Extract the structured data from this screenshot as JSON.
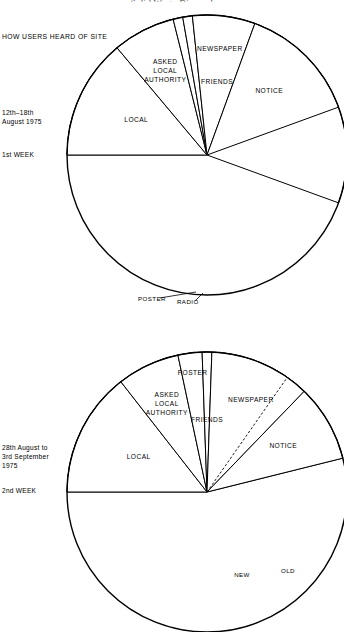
{
  "figure": {
    "title": "Solid Waste Disposal",
    "heading": "HOW USERS HEARD OF SITE"
  },
  "charts": [
    {
      "id": "week-1",
      "period_label": "12th–18th\nAugust 1975",
      "week_label": "1st WEEK",
      "center": [
        207,
        155
      ],
      "radius": 140,
      "slices": [
        {
          "name": "FRIENDS",
          "start": 180,
          "end": 380,
          "label": "FRIENDS",
          "label_r": 72,
          "label_a": 278
        },
        {
          "name": "LOCAL",
          "start": 180,
          "end": 230,
          "label": "LOCAL",
          "label_r": 78,
          "label_a": 205
        },
        {
          "name": "ASKED LOCAL AUTHORITY",
          "start": 230,
          "end": 256,
          "label": "ASKED\nLOCAL\nAUTHORITY",
          "label_r": 92,
          "label_a": 243
        },
        {
          "name": "POSTER",
          "start": 256,
          "end": 260,
          "label": null
        },
        {
          "name": "RADIO",
          "start": 260,
          "end": 264,
          "label": null
        },
        {
          "name": "NEWSPAPER",
          "start": 264,
          "end": 290,
          "label": "NEWSPAPER",
          "label_r": 105,
          "label_a": 277
        },
        {
          "name": "NOTICE",
          "start": 290,
          "end": 340,
          "label": "NOTICE",
          "label_r": 88,
          "label_a": 315
        }
      ],
      "leaders": [
        {
          "text": "POSTER",
          "x": 138,
          "y": 301,
          "to": [
            196,
            292
          ]
        },
        {
          "text": "RADIO",
          "x": 177,
          "y": 304,
          "to": [
            203,
            293
          ]
        }
      ],
      "dashed_splits": []
    },
    {
      "id": "week-2",
      "period_label": "28th August to\n3rd September\n1975",
      "week_label": "2nd WEEK",
      "center": [
        207,
        492
      ],
      "radius": 140,
      "slices": [
        {
          "name": "FRIENDS",
          "start": 180,
          "end": 346,
          "label": "FRIENDS",
          "label_r": 70,
          "label_a": 270
        },
        {
          "name": "LOCAL",
          "start": 180,
          "end": 232,
          "label": "LOCAL",
          "label_r": 76,
          "label_a": 206
        },
        {
          "name": "ASKED LOCAL AUTHORITY",
          "start": 232,
          "end": 258,
          "label": "ASKED\nLOCAL\nAUTHORITY",
          "label_r": 95,
          "label_a": 245
        },
        {
          "name": "POSTER",
          "start": 258,
          "end": 268,
          "label": "POSTER",
          "label_r": 118,
          "label_a": 263
        },
        {
          "name": "RADIO",
          "start": 268,
          "end": 272,
          "label": null
        },
        {
          "name": "NEWSPAPER",
          "start": 272,
          "end": 314,
          "label": "NEWSPAPER",
          "label_r": 100,
          "label_a": 296
        },
        {
          "name": "NOTICE",
          "start": 314,
          "end": 346,
          "label": "NOTICE",
          "label_r": 88,
          "label_a": 330
        }
      ],
      "sub_labels": [
        {
          "text": "NEW",
          "x": 242,
          "y": 577
        },
        {
          "text": "OLD",
          "x": 288,
          "y": 573
        }
      ],
      "leaders": [],
      "dashed_splits": [
        305
      ]
    }
  ]
}
